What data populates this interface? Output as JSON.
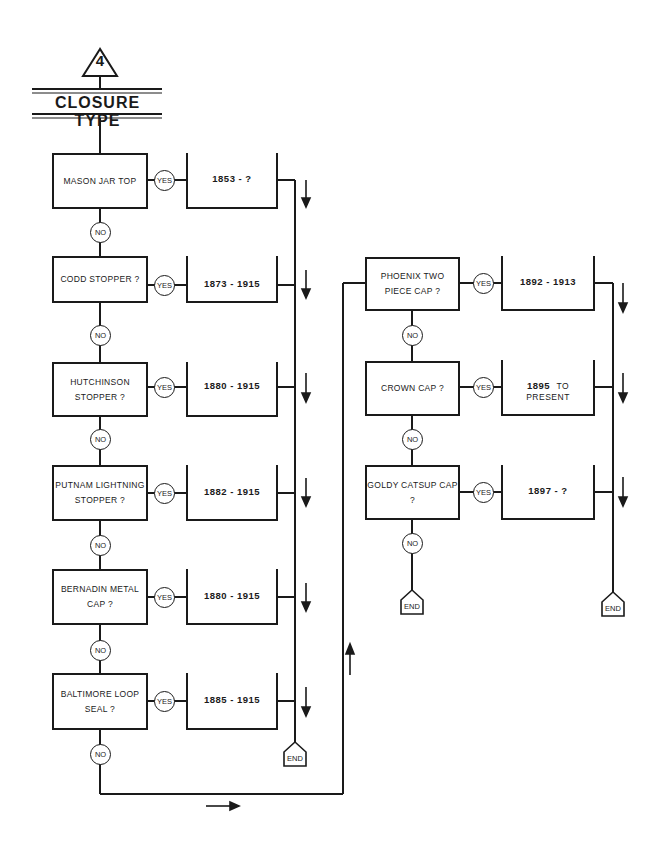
{
  "header": {
    "step_number": "4",
    "title": "CLOSURE TYPE"
  },
  "labels": {
    "yes": "YES",
    "no": "NO",
    "end": "END"
  },
  "left_column": [
    {
      "question": "MASON JAR TOP",
      "date_range": "1853 - ?"
    },
    {
      "question": "CODD STOPPER  ?",
      "date_range": "1873 - 1915"
    },
    {
      "question": "HUTCHINSON\nSTOPPER   ?",
      "date_range": "1880 - 1915"
    },
    {
      "question": "PUTNAM LIGHTNING\nSTOPPER  ?",
      "date_range": "1882 - 1915"
    },
    {
      "question": "BERNADIN METAL\nCAP  ?",
      "date_range": "1880 - 1915"
    },
    {
      "question": "BALTIMORE LOOP\nSEAL  ?",
      "date_range": "1885 - 1915"
    }
  ],
  "right_column": [
    {
      "question": "PHOENIX TWO\nPIECE CAP  ?",
      "date_range": "1892 - 1913"
    },
    {
      "question": "CROWN CAP   ?",
      "date_start": "1895",
      "date_suffix": "TO PRESENT"
    },
    {
      "question": "GOLDY CATSUP CAP\n?",
      "date_range": "1897 - ?"
    }
  ],
  "colors": {
    "ink": "#1a1a1a",
    "background": "#ffffff"
  }
}
